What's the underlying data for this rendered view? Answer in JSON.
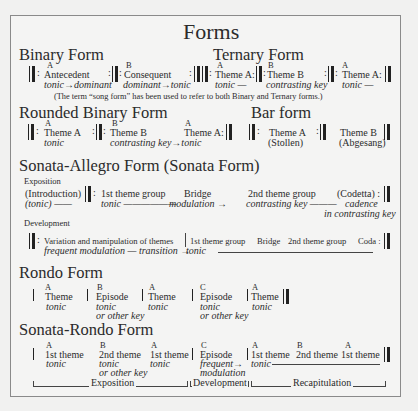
{
  "title": "Forms",
  "binary": {
    "heading": "Binary Form",
    "sections": [
      {
        "letter": "A",
        "name": "Antecedent",
        "key": "tonic→dominant"
      },
      {
        "letter": "B",
        "name": "Consequent",
        "key": "dominant→tonic"
      }
    ]
  },
  "ternary": {
    "heading": "Ternary Form",
    "sections": [
      {
        "letter": "A",
        "name": "Theme A:",
        "key": "tonic —"
      },
      {
        "letter": "B",
        "name": "Theme B",
        "key": "contrasting key"
      },
      {
        "letter": "A",
        "name": "Theme A:",
        "key": "tonic —"
      }
    ]
  },
  "note": "(The term “song form” has been used to refer to both Binary and Ternary forms.)",
  "rounded_binary": {
    "heading": "Rounded Binary Form",
    "sections": [
      {
        "letter": "A",
        "name": "Theme A",
        "key": "tonic"
      },
      {
        "letter": "B",
        "name": "Theme B",
        "key": "contrasting key→tonic"
      },
      {
        "letter": "A",
        "name": "Theme A:",
        "key": ""
      }
    ]
  },
  "bar_form": {
    "heading": "Bar form",
    "sections": [
      {
        "name": "Theme A",
        "sub": "(Stollen)"
      },
      {
        "name": "Theme B",
        "sub": "(Abgesang)"
      }
    ]
  },
  "sonata": {
    "heading": "Sonata-Allegro Form (Sonata Form)",
    "exposition": {
      "label": "Exposition",
      "parts": [
        {
          "name": "(Introduction)",
          "key": "(tonic) ——"
        },
        {
          "name": "1st theme group",
          "key": "tonic ——————"
        },
        {
          "name": "Bridge",
          "key": "modulation →"
        },
        {
          "name": "2nd theme group",
          "key": "contrasting key ———"
        },
        {
          "name": "(Codetta) :",
          "key": "cadence",
          "key2": "in contrasting key"
        }
      ]
    },
    "development": {
      "label": "Development",
      "text": "Variation and manipulation of themes",
      "key": "frequent modulation — transition →",
      "recap": [
        "1st theme group",
        "Bridge",
        "2nd theme group",
        "Coda :"
      ],
      "recap_key": "tonic"
    }
  },
  "rondo": {
    "heading": "Rondo Form",
    "sections": [
      {
        "letter": "A",
        "name": "Theme",
        "key": "tonic",
        "key2": ""
      },
      {
        "letter": "B",
        "name": "Episode",
        "key": "tonic",
        "key2": "or other key"
      },
      {
        "letter": "A",
        "name": "Theme",
        "key": "tonic",
        "key2": ""
      },
      {
        "letter": "C",
        "name": "Episode",
        "key": "tonic",
        "key2": "or other key"
      },
      {
        "letter": "A",
        "name": "Theme",
        "key": "tonic",
        "key2": ""
      }
    ]
  },
  "sonata_rondo": {
    "heading": "Sonata-Rondo Form",
    "sections": [
      {
        "letter": "A",
        "name": "1st theme",
        "key": "tonic",
        "key2": ""
      },
      {
        "letter": "B",
        "name": "2nd theme",
        "key": "tonic",
        "key2": "or other key"
      },
      {
        "letter": "A",
        "name": "1st theme",
        "key": "tonic",
        "key2": ""
      },
      {
        "letter": "C",
        "name": "Episode",
        "key": "frequent→",
        "key2": "modulation"
      },
      {
        "letter": "A",
        "name": "1st theme",
        "key": "tonic",
        "key2": ""
      },
      {
        "letter": "B",
        "name": "2nd theme",
        "key": "",
        "key2": ""
      },
      {
        "letter": "A",
        "name": "1st theme",
        "key": "",
        "key2": ""
      }
    ],
    "brackets": [
      "Exposition",
      "Development",
      "Recapitulation"
    ]
  }
}
